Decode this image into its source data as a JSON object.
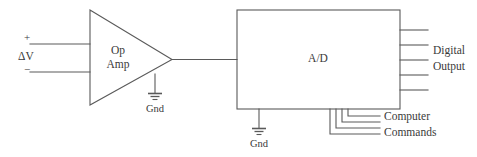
{
  "diagram": {
    "colors": {
      "stroke": "#5a5a5a",
      "text": "#3a3a3a",
      "background": "#ffffff"
    },
    "opamp": {
      "label_line1": "Op",
      "label_line2": "Amp",
      "input_plus": "+",
      "input_minus": "−",
      "differential_label": "ΔV",
      "ground_label": "Gnd"
    },
    "adc": {
      "label": "A/D",
      "ground_label": "Gnd",
      "output_label_line1": "Digital",
      "output_label_line2": "Output",
      "command_label_line1": "Computer",
      "command_label_line2": "Commands",
      "output_line_count": 5,
      "command_line_count": 4
    }
  }
}
